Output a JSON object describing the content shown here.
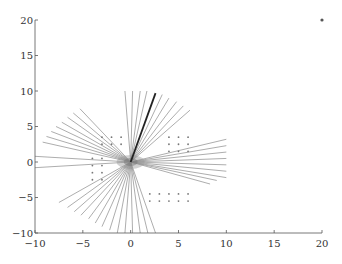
{
  "chart_data": {
    "type": "line",
    "title": "",
    "xlabel": "",
    "ylabel": "",
    "xlim": [
      -10,
      20
    ],
    "ylim": [
      -10,
      20
    ],
    "grid": false,
    "legend": null,
    "x_ticks": [
      -10,
      -5,
      0,
      5,
      10,
      15,
      20
    ],
    "y_ticks": [
      -10,
      -5,
      0,
      5,
      10,
      15,
      20
    ],
    "x_tick_labels": [
      "−10",
      "−5",
      "0",
      "5",
      "10",
      "15",
      "20"
    ],
    "y_tick_labels": [
      "−10",
      "−5",
      "0",
      "5",
      "10",
      "15",
      "20"
    ],
    "rays": {
      "origin": [
        0,
        0
      ],
      "color": "#8a8a8a",
      "endpoints": [
        [
          -10,
          0.8
        ],
        [
          -10,
          -0.8
        ],
        [
          -9.2,
          2.8
        ],
        [
          -8.8,
          3.6
        ],
        [
          -8.3,
          4.3
        ],
        [
          -7.8,
          5.0
        ],
        [
          -7.2,
          5.6
        ],
        [
          -6.6,
          6.3
        ],
        [
          -6.0,
          6.9
        ],
        [
          -5.3,
          7.5
        ],
        [
          -0.6,
          10
        ],
        [
          0.2,
          10
        ],
        [
          1.0,
          10
        ],
        [
          1.7,
          10
        ],
        [
          3.3,
          9.5
        ],
        [
          4.0,
          9.0
        ],
        [
          4.8,
          8.5
        ],
        [
          5.5,
          7.9
        ],
        [
          6.2,
          7.3
        ],
        [
          10,
          3.2
        ],
        [
          10,
          2.3
        ],
        [
          10,
          1.4
        ],
        [
          10,
          0.5
        ],
        [
          10,
          -0.4
        ],
        [
          10,
          -1.3
        ],
        [
          10,
          -2.2
        ],
        [
          9.0,
          -2.6
        ],
        [
          8.3,
          -3.1
        ],
        [
          2.6,
          -10
        ],
        [
          1.8,
          -10
        ],
        [
          1.0,
          -10
        ],
        [
          0.2,
          -10
        ],
        [
          -0.6,
          -10
        ],
        [
          -1.4,
          -10
        ],
        [
          -2.2,
          -9.6
        ],
        [
          -3.0,
          -9.1
        ],
        [
          -3.7,
          -8.6
        ],
        [
          -4.4,
          -8.0
        ],
        [
          -5.2,
          -7.5
        ],
        [
          -5.9,
          -7.0
        ],
        [
          -6.6,
          -6.4
        ],
        [
          -7.5,
          -5.7
        ]
      ]
    },
    "highlight_ray": {
      "from": [
        0,
        0
      ],
      "to": [
        2.6,
        9.7
      ],
      "color": "#222222"
    },
    "markers": {
      "color": "#777777",
      "points": [
        [
          -3,
          3.5
        ],
        [
          -2,
          3.5
        ],
        [
          -1,
          3.5
        ],
        [
          -3,
          2.5
        ],
        [
          -2,
          2.5
        ],
        [
          -1,
          2.5
        ],
        [
          -4,
          0.5
        ],
        [
          -3,
          0.5
        ],
        [
          -4,
          -0.5
        ],
        [
          -3,
          -0.5
        ],
        [
          -4,
          -1.5
        ],
        [
          -3,
          -1.5
        ],
        [
          -4,
          -2.5
        ],
        [
          -3,
          -2.5
        ],
        [
          4,
          3.5
        ],
        [
          5,
          3.5
        ],
        [
          6,
          3.5
        ],
        [
          4,
          2.5
        ],
        [
          5,
          2.5
        ],
        [
          6,
          2.5
        ],
        [
          4,
          1.5
        ],
        [
          5,
          1.5
        ],
        [
          6,
          1.5
        ],
        [
          2,
          -4.5
        ],
        [
          3,
          -4.5
        ],
        [
          4,
          -4.5
        ],
        [
          5,
          -4.5
        ],
        [
          6,
          -4.5
        ],
        [
          2,
          -5.5
        ],
        [
          3,
          -5.5
        ],
        [
          4,
          -5.5
        ],
        [
          5,
          -5.5
        ],
        [
          6,
          -5.5
        ]
      ]
    },
    "outlier_marker": {
      "point": [
        20,
        20
      ],
      "color": "#555555"
    }
  }
}
